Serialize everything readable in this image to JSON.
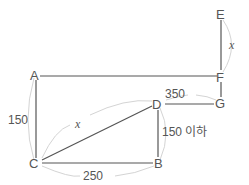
{
  "diagram": {
    "points": {
      "A": {
        "label": "A"
      },
      "B": {
        "label": "B"
      },
      "C": {
        "label": "C"
      },
      "D": {
        "label": "D"
      },
      "E": {
        "label": "E"
      },
      "F": {
        "label": "F"
      },
      "G": {
        "label": "G"
      }
    },
    "segments": [
      {
        "from": "A",
        "to": "F"
      },
      {
        "from": "A",
        "to": "C"
      },
      {
        "from": "C",
        "to": "B"
      },
      {
        "from": "B",
        "to": "D"
      },
      {
        "from": "C",
        "to": "D"
      },
      {
        "from": "D",
        "to": "G"
      },
      {
        "from": "E",
        "to": "F"
      },
      {
        "from": "F",
        "to": "G"
      }
    ],
    "measurements": {
      "AC": "150",
      "CB": "250",
      "DB": "150 이하",
      "CD": "x",
      "DG": "350",
      "EF": "x"
    }
  }
}
